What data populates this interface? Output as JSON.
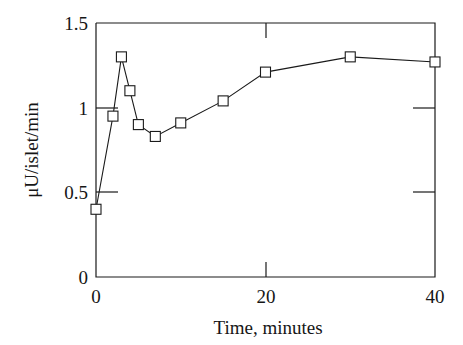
{
  "chart_data": {
    "type": "line",
    "title": "",
    "subtitle": "",
    "xlabel": "Time, minutes",
    "ylabel": "μU/islet/min",
    "xlim": [
      0,
      40
    ],
    "ylim": [
      0,
      1.5
    ],
    "xticks": [
      0,
      20,
      40
    ],
    "xtick_labels": [
      "0",
      "20",
      "40"
    ],
    "yticks": [
      0,
      0.5,
      1,
      1.5
    ],
    "ytick_labels": [
      "0",
      "0.5",
      "1",
      "1.5"
    ],
    "grid": false,
    "legend": "none",
    "marker": "open-square",
    "series": [
      {
        "name": "insulin secretion",
        "x": [
          0,
          2,
          3,
          4,
          5,
          7,
          10,
          15,
          20,
          30,
          40
        ],
        "values": [
          0.4,
          0.95,
          1.3,
          1.1,
          0.9,
          0.83,
          0.91,
          1.04,
          1.21,
          1.3,
          1.27
        ]
      }
    ]
  },
  "figure": {
    "caption": ""
  }
}
